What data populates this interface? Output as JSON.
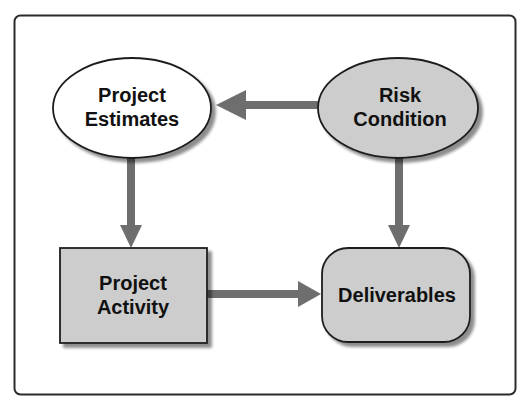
{
  "diagram": {
    "type": "flowchart",
    "colors": {
      "frame_border": "#2b2b2b",
      "node_border": "#1e1e1e",
      "gray_fill": "#cdcdcd",
      "white_fill": "#ffffff",
      "arrow": "#6e6e6e",
      "shadow": "#9a9a9a"
    },
    "nodes": [
      {
        "id": "project-estimates",
        "shape": "ellipse",
        "fill": "white",
        "lines": [
          "Project",
          "Estimates"
        ]
      },
      {
        "id": "risk-condition",
        "shape": "ellipse",
        "fill": "gray",
        "lines": [
          "Risk",
          "Condition"
        ]
      },
      {
        "id": "project-activity",
        "shape": "rectangle",
        "fill": "gray",
        "lines": [
          "Project",
          "Activity"
        ]
      },
      {
        "id": "deliverables",
        "shape": "rounded-rectangle",
        "fill": "gray",
        "lines": [
          "Deliverables"
        ]
      }
    ],
    "edges": [
      {
        "from": "risk-condition",
        "to": "project-estimates"
      },
      {
        "from": "project-estimates",
        "to": "project-activity"
      },
      {
        "from": "risk-condition",
        "to": "deliverables"
      },
      {
        "from": "project-activity",
        "to": "deliverables"
      }
    ]
  }
}
